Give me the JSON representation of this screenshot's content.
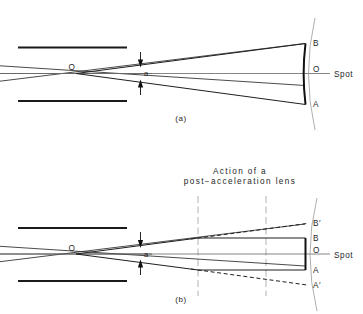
{
  "figure": {
    "background_color": "#ffffff",
    "ink_color": "#1f1f1f",
    "axis_color": "#6f6f6f",
    "faint_color": "#9a9a9a"
  },
  "panel_a": {
    "caption": "(a)",
    "crossover_label": "O",
    "angle_label": "a",
    "screen_center_label": "O",
    "spot_label": "Spot",
    "top_edge_label": "B",
    "bottom_edge_label": "A"
  },
  "panel_b": {
    "caption": "(b)",
    "crossover_label": "O",
    "angle_label": "a",
    "title_line_1": "Action of a",
    "title_line_2": "post−acceleration lens",
    "screen_center_label": "O",
    "spot_label": "Spot",
    "top_edge_label": "B",
    "bottom_edge_label": "A",
    "top_virtual_label": "B′",
    "bottom_virtual_label": "A′"
  }
}
